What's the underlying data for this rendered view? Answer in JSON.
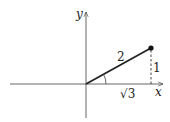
{
  "diagram": {
    "type": "right-triangle-on-axes",
    "axes": {
      "x_label": "x",
      "y_label": "y"
    },
    "segments": {
      "hypotenuse_label": "2",
      "opposite_label": "1",
      "adjacent_label": "√3"
    },
    "colors": {
      "stroke": "#222222",
      "background": "#ffffff"
    }
  }
}
